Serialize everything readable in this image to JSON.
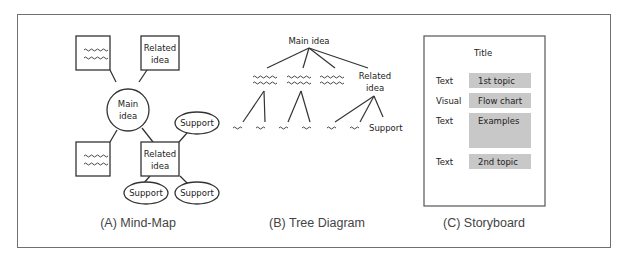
{
  "panels": {
    "mindmap": {
      "caption": "(A) Mind-Map",
      "main_node": {
        "line1": "Main",
        "line2": "idea"
      },
      "related_top": {
        "line1": "Related",
        "line2": "idea"
      },
      "related_bottom": {
        "line1": "Related",
        "line2": "idea"
      },
      "support_labels": [
        "Support",
        "Support",
        "Support"
      ]
    },
    "tree": {
      "caption": "(B) Tree Diagram",
      "root": "Main idea",
      "related": {
        "line1": "Related",
        "line2": "idea"
      },
      "leaf_label": "Support"
    },
    "storyboard": {
      "caption": "(C) Storyboard",
      "title": "Title",
      "rows": [
        {
          "label": "Text",
          "content": "1st topic"
        },
        {
          "label": "Visual",
          "content": "Flow chart"
        },
        {
          "label": "Text",
          "content": "Examples"
        },
        {
          "label": "Text",
          "content": "2nd topic"
        }
      ]
    }
  },
  "colors": {
    "stroke": "#333333",
    "frame": "#707070",
    "storyboard_fill": "#c8c8c8",
    "text": "#222222"
  }
}
